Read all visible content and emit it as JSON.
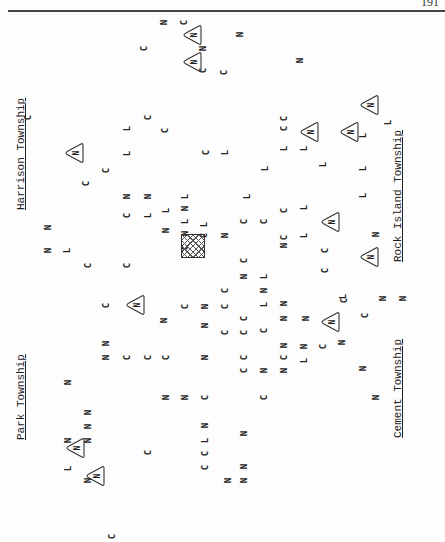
{
  "page": {
    "number": "191"
  },
  "labels": {
    "harrison": "Harrison Township",
    "rock_island": "Rock Island Township",
    "park": "Park Township",
    "cement": "Cement Township"
  },
  "legend_symbols": {
    "C": "C",
    "N": "N",
    "L": "L",
    "triangle_icon": "triangle-N",
    "hatched_box_icon": "hatched-square"
  },
  "markers": [
    {
      "t": "N",
      "x": 164,
      "y": 22
    },
    {
      "t": "C",
      "x": 184,
      "y": 22
    },
    {
      "t": "N",
      "x": 240,
      "y": 34
    },
    {
      "t": "C",
      "x": 144,
      "y": 48
    },
    {
      "t": "N",
      "x": 203,
      "y": 48
    },
    {
      "t": "N",
      "x": 300,
      "y": 60
    },
    {
      "t": "C",
      "x": 203,
      "y": 70
    },
    {
      "t": "C",
      "x": 224,
      "y": 72
    },
    {
      "t": "C",
      "x": 28,
      "y": 117
    },
    {
      "t": "C",
      "x": 148,
      "y": 117
    },
    {
      "t": "L",
      "x": 127,
      "y": 128
    },
    {
      "t": "L",
      "x": 127,
      "y": 153
    },
    {
      "t": "C",
      "x": 165,
      "y": 130
    },
    {
      "t": "C",
      "x": 206,
      "y": 152
    },
    {
      "t": "L",
      "x": 225,
      "y": 152
    },
    {
      "t": "C",
      "x": 284,
      "y": 128
    },
    {
      "t": "L",
      "x": 284,
      "y": 148
    },
    {
      "t": "C",
      "x": 86,
      "y": 183
    },
    {
      "t": "C",
      "x": 106,
      "y": 170
    },
    {
      "t": "N",
      "x": 127,
      "y": 196
    },
    {
      "t": "N",
      "x": 148,
      "y": 196
    },
    {
      "t": "C",
      "x": 127,
      "y": 215
    },
    {
      "t": "L",
      "x": 148,
      "y": 215
    },
    {
      "t": "L",
      "x": 166,
      "y": 210
    },
    {
      "t": "N",
      "x": 166,
      "y": 230
    },
    {
      "t": "L",
      "x": 185,
      "y": 196
    },
    {
      "t": "N",
      "x": 185,
      "y": 208
    },
    {
      "t": "L",
      "x": 185,
      "y": 221
    },
    {
      "t": "N",
      "x": 185,
      "y": 233
    },
    {
      "t": "C",
      "x": 185,
      "y": 247
    },
    {
      "t": "L",
      "x": 204,
      "y": 224
    },
    {
      "t": "C",
      "x": 204,
      "y": 235
    },
    {
      "t": "N",
      "x": 225,
      "y": 235
    },
    {
      "t": "L",
      "x": 247,
      "y": 196
    },
    {
      "t": "C",
      "x": 244,
      "y": 221
    },
    {
      "t": "C",
      "x": 264,
      "y": 221
    },
    {
      "t": "L",
      "x": 265,
      "y": 168
    },
    {
      "t": "C",
      "x": 284,
      "y": 237
    },
    {
      "t": "N",
      "x": 284,
      "y": 245
    },
    {
      "t": "C",
      "x": 284,
      "y": 210
    },
    {
      "t": "L",
      "x": 304,
      "y": 207
    },
    {
      "t": "L",
      "x": 304,
      "y": 235
    },
    {
      "t": "L",
      "x": 304,
      "y": 148
    },
    {
      "t": "C",
      "x": 244,
      "y": 260
    },
    {
      "t": "L",
      "x": 264,
      "y": 276
    },
    {
      "t": "N",
      "x": 244,
      "y": 276
    },
    {
      "t": "N",
      "x": 48,
      "y": 227
    },
    {
      "t": "N",
      "x": 48,
      "y": 250
    },
    {
      "t": "L",
      "x": 67,
      "y": 250
    },
    {
      "t": "C",
      "x": 88,
      "y": 265
    },
    {
      "t": "C",
      "x": 127,
      "y": 265
    },
    {
      "t": "C",
      "x": 106,
      "y": 305
    },
    {
      "t": "N",
      "x": 164,
      "y": 320
    },
    {
      "t": "N",
      "x": 205,
      "y": 306
    },
    {
      "t": "C",
      "x": 225,
      "y": 290
    },
    {
      "t": "C",
      "x": 225,
      "y": 306
    },
    {
      "t": "N",
      "x": 205,
      "y": 325
    },
    {
      "t": "C",
      "x": 185,
      "y": 306
    },
    {
      "t": "C",
      "x": 244,
      "y": 318
    },
    {
      "t": "N",
      "x": 264,
      "y": 290
    },
    {
      "t": "L",
      "x": 264,
      "y": 304
    },
    {
      "t": "N",
      "x": 284,
      "y": 318
    },
    {
      "t": "N",
      "x": 284,
      "y": 303
    },
    {
      "t": "C",
      "x": 225,
      "y": 332
    },
    {
      "t": "C",
      "x": 244,
      "y": 332
    },
    {
      "t": "C",
      "x": 264,
      "y": 330
    },
    {
      "t": "N",
      "x": 306,
      "y": 318
    },
    {
      "t": "N",
      "x": 304,
      "y": 346
    },
    {
      "t": "L",
      "x": 304,
      "y": 360
    },
    {
      "t": "C",
      "x": 323,
      "y": 346
    },
    {
      "t": "N",
      "x": 342,
      "y": 342
    },
    {
      "t": "C",
      "x": 365,
      "y": 315
    },
    {
      "t": "N",
      "x": 383,
      "y": 298
    },
    {
      "t": "N",
      "x": 403,
      "y": 298
    },
    {
      "t": "C",
      "x": 344,
      "y": 300
    },
    {
      "t": "C",
      "x": 325,
      "y": 270
    },
    {
      "t": "N",
      "x": 363,
      "y": 368
    },
    {
      "t": "L",
      "x": 343,
      "y": 296
    },
    {
      "t": "N",
      "x": 376,
      "y": 234
    },
    {
      "t": "C",
      "x": 325,
      "y": 250
    },
    {
      "t": "L",
      "x": 323,
      "y": 164
    },
    {
      "t": "L",
      "x": 363,
      "y": 168
    },
    {
      "t": "L",
      "x": 363,
      "y": 195
    },
    {
      "t": "L",
      "x": 388,
      "y": 122
    },
    {
      "t": "L",
      "x": 363,
      "y": 135
    },
    {
      "t": "C",
      "x": 284,
      "y": 118
    },
    {
      "t": "N",
      "x": 68,
      "y": 382
    },
    {
      "t": "N",
      "x": 106,
      "y": 357
    },
    {
      "t": "N",
      "x": 106,
      "y": 343
    },
    {
      "t": "C",
      "x": 127,
      "y": 357
    },
    {
      "t": "C",
      "x": 148,
      "y": 357
    },
    {
      "t": "C",
      "x": 166,
      "y": 357
    },
    {
      "t": "N",
      "x": 205,
      "y": 357
    },
    {
      "t": "C",
      "x": 244,
      "y": 357
    },
    {
      "t": "C",
      "x": 244,
      "y": 370
    },
    {
      "t": "N",
      "x": 264,
      "y": 370
    },
    {
      "t": "N",
      "x": 284,
      "y": 370
    },
    {
      "t": "C",
      "x": 284,
      "y": 357
    },
    {
      "t": "N",
      "x": 284,
      "y": 345
    },
    {
      "t": "N",
      "x": 166,
      "y": 397
    },
    {
      "t": "N",
      "x": 185,
      "y": 397
    },
    {
      "t": "C",
      "x": 205,
      "y": 397
    },
    {
      "t": "C",
      "x": 264,
      "y": 397
    },
    {
      "t": "N",
      "x": 376,
      "y": 397
    },
    {
      "t": "N",
      "x": 88,
      "y": 412
    },
    {
      "t": "N",
      "x": 88,
      "y": 426
    },
    {
      "t": "N",
      "x": 88,
      "y": 440
    },
    {
      "t": "N",
      "x": 68,
      "y": 440
    },
    {
      "t": "L",
      "x": 68,
      "y": 468
    },
    {
      "t": "N",
      "x": 88,
      "y": 480
    },
    {
      "t": "C",
      "x": 148,
      "y": 452
    },
    {
      "t": "N",
      "x": 205,
      "y": 425
    },
    {
      "t": "L",
      "x": 205,
      "y": 440
    },
    {
      "t": "C",
      "x": 205,
      "y": 453
    },
    {
      "t": "C",
      "x": 205,
      "y": 467
    },
    {
      "t": "N",
      "x": 244,
      "y": 433
    },
    {
      "t": "N",
      "x": 244,
      "y": 466
    },
    {
      "t": "N",
      "x": 244,
      "y": 480
    },
    {
      "t": "N",
      "x": 228,
      "y": 480
    },
    {
      "t": "C",
      "x": 112,
      "y": 536
    }
  ],
  "triangles": [
    {
      "t": "N",
      "x": 193,
      "y": 35
    },
    {
      "t": "N",
      "x": 193,
      "y": 62
    },
    {
      "t": "N",
      "x": 75,
      "y": 153
    },
    {
      "t": "N",
      "x": 136,
      "y": 305
    },
    {
      "t": "N",
      "x": 331,
      "y": 222
    },
    {
      "t": "N",
      "x": 370,
      "y": 257
    },
    {
      "t": "N",
      "x": 331,
      "y": 322
    },
    {
      "t": "N",
      "x": 310,
      "y": 132
    },
    {
      "t": "N",
      "x": 350,
      "y": 132
    },
    {
      "t": "N",
      "x": 370,
      "y": 105
    },
    {
      "t": "N",
      "x": 76,
      "y": 448
    },
    {
      "t": "N",
      "x": 96,
      "y": 476
    }
  ],
  "hatched_box": {
    "x": 192,
    "y": 245
  }
}
